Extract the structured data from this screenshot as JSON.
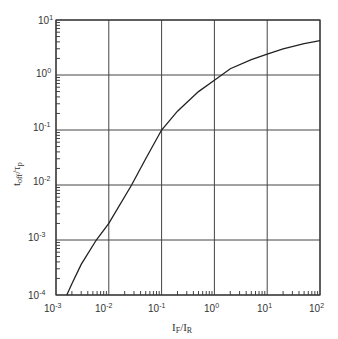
{
  "chart_data": {
    "type": "line",
    "title": "",
    "xlabel": "I_F/I_R",
    "ylabel": "t_off/τ_p",
    "xscale": "log",
    "yscale": "log",
    "xlim": [
      0.001,
      100
    ],
    "ylim": [
      0.0001,
      10
    ],
    "grid": true,
    "legend": null,
    "x_tick_labels": [
      "10^-3",
      "10^-2",
      "10^-1",
      "10^0",
      "10^1",
      "10^2"
    ],
    "y_tick_labels": [
      "10^-4",
      "10^-3",
      "10^-2",
      "10^-1",
      "10^0",
      "10^1"
    ],
    "series": [
      {
        "name": "t_off/τ_p",
        "x": [
          0.0016,
          0.002,
          0.003,
          0.0058,
          0.01,
          0.027,
          0.05,
          0.1,
          0.2,
          0.5,
          1,
          2,
          5,
          10,
          20,
          50,
          100
        ],
        "y": [
          0.0001,
          0.00016,
          0.00036,
          0.001,
          0.002,
          0.01,
          0.03,
          0.1,
          0.22,
          0.5,
          0.8,
          1.3,
          1.9,
          2.4,
          3.0,
          3.7,
          4.2
        ]
      }
    ]
  },
  "axes": {
    "x_title_main": "I",
    "x_title_sub1": "F",
    "x_title_mid": "/I",
    "x_title_sub2": "R",
    "y_title_main": "t",
    "y_title_sub1": "off",
    "y_title_mid": "/τ",
    "y_title_sub2": "p",
    "x_ticks": [
      {
        "base": "10",
        "exp": "-3"
      },
      {
        "base": "10",
        "exp": "-2"
      },
      {
        "base": "10",
        "exp": "-1"
      },
      {
        "base": "10",
        "exp": "0"
      },
      {
        "base": "10",
        "exp": "1"
      },
      {
        "base": "10",
        "exp": "2"
      }
    ],
    "y_ticks": [
      {
        "base": "10",
        "exp": "1"
      },
      {
        "base": "10",
        "exp": "0"
      },
      {
        "base": "10",
        "exp": "-1"
      },
      {
        "base": "10",
        "exp": "-2"
      },
      {
        "base": "10",
        "exp": "-3"
      },
      {
        "base": "10",
        "exp": "-4"
      }
    ]
  }
}
